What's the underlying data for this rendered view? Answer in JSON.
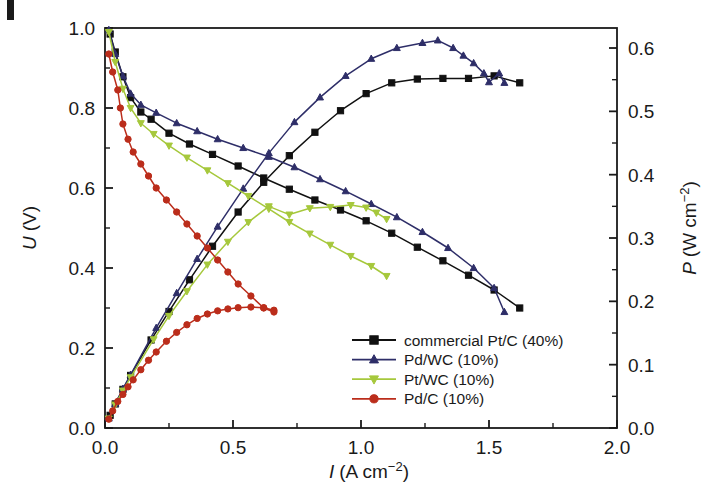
{
  "figure": {
    "panel_mark": "",
    "background": "#ffffff"
  },
  "chart_data": {
    "type": "line",
    "title": "",
    "subtitle": "",
    "xlabel": "I (A cm−2)",
    "xlabel_symbol": "I",
    "xlabel_unit": "(A cm",
    "xlabel_exp": "−2",
    "xlabel_close": ")",
    "ylabel_left": "U (V)",
    "ylabel_left_symbol": "U",
    "ylabel_left_unit": "(V)",
    "ylabel_right": "P (W cm−2)",
    "ylabel_right_symbol": "P",
    "ylabel_right_unit": "(W cm",
    "ylabel_right_exp": "−2",
    "ylabel_right_close": ")",
    "xlim": [
      0.0,
      2.0
    ],
    "ylim_left": [
      0.0,
      1.0
    ],
    "ylim_right": [
      0.0,
      0.6316
    ],
    "xticks": [
      0.0,
      0.5,
      1.0,
      1.5,
      2.0
    ],
    "xtick_labels": [
      "0.0",
      "0.5",
      "1.0",
      "1.5",
      "2.0"
    ],
    "xminor_step": 0.25,
    "yticks_left": [
      0.0,
      0.2,
      0.4,
      0.6,
      0.8,
      1.0
    ],
    "ytick_labels_left": [
      "0.0",
      "0.2",
      "0.4",
      "0.6",
      "0.8",
      "1.0"
    ],
    "yminor_step_left": 0.1,
    "yticks_right": [
      0.0,
      0.1,
      0.2,
      0.3,
      0.4,
      0.5,
      0.6
    ],
    "ytick_labels_right": [
      "0.0",
      "0.1",
      "0.2",
      "0.3",
      "0.4",
      "0.5",
      "0.6"
    ],
    "yminor_step_right": 0.05,
    "grid": false,
    "legend_position": "lower right",
    "legend": [
      {
        "label": "commercial Pt/C (40%)",
        "color": "#111111",
        "marker": "square"
      },
      {
        "label": "Pd/WC (10%)",
        "color": "#2e2e68",
        "marker": "triangle-up"
      },
      {
        "label": "Pt/WC (10%)",
        "color": "#a6c83c",
        "marker": "triangle-down"
      },
      {
        "label": "Pd/C (10%)",
        "color": "#bb2d1b",
        "marker": "circle"
      }
    ],
    "series": [
      {
        "name": "commercial Pt/C (40%) polarization",
        "axis": "left",
        "quantity": "U",
        "color": "#111111",
        "marker": "square",
        "points": [
          [
            0.02,
            0.985
          ],
          [
            0.04,
            0.94
          ],
          [
            0.07,
            0.878
          ],
          [
            0.1,
            0.826
          ],
          [
            0.14,
            0.79
          ],
          [
            0.18,
            0.772
          ],
          [
            0.25,
            0.737
          ],
          [
            0.33,
            0.71
          ],
          [
            0.42,
            0.684
          ],
          [
            0.52,
            0.655
          ],
          [
            0.62,
            0.625
          ],
          [
            0.72,
            0.597
          ],
          [
            0.82,
            0.57
          ],
          [
            0.92,
            0.545
          ],
          [
            1.02,
            0.518
          ],
          [
            1.12,
            0.487
          ],
          [
            1.22,
            0.452
          ],
          [
            1.32,
            0.418
          ],
          [
            1.42,
            0.382
          ],
          [
            1.52,
            0.345
          ],
          [
            1.62,
            0.3
          ]
        ]
      },
      {
        "name": "commercial Pt/C (40%) power",
        "axis": "right",
        "quantity": "P",
        "color": "#111111",
        "marker": "square",
        "points": [
          [
            0.02,
            0.02
          ],
          [
            0.04,
            0.038
          ],
          [
            0.07,
            0.061
          ],
          [
            0.1,
            0.083
          ],
          [
            0.18,
            0.139
          ],
          [
            0.25,
            0.184
          ],
          [
            0.33,
            0.234
          ],
          [
            0.42,
            0.287
          ],
          [
            0.52,
            0.341
          ],
          [
            0.62,
            0.388
          ],
          [
            0.72,
            0.43
          ],
          [
            0.82,
            0.467
          ],
          [
            0.92,
            0.501
          ],
          [
            1.02,
            0.528
          ],
          [
            1.12,
            0.545
          ],
          [
            1.22,
            0.551
          ],
          [
            1.32,
            0.552
          ],
          [
            1.42,
            0.552
          ],
          [
            1.52,
            0.556
          ],
          [
            1.62,
            0.545
          ]
        ]
      },
      {
        "name": "Pd/WC (10%) polarization",
        "axis": "left",
        "quantity": "U",
        "color": "#2e2e68",
        "marker": "triangle-up",
        "points": [
          [
            0.015,
            0.995
          ],
          [
            0.04,
            0.935
          ],
          [
            0.07,
            0.88
          ],
          [
            0.1,
            0.836
          ],
          [
            0.14,
            0.808
          ],
          [
            0.2,
            0.788
          ],
          [
            0.28,
            0.762
          ],
          [
            0.36,
            0.742
          ],
          [
            0.44,
            0.722
          ],
          [
            0.54,
            0.7
          ],
          [
            0.64,
            0.678
          ],
          [
            0.74,
            0.652
          ],
          [
            0.84,
            0.622
          ],
          [
            0.94,
            0.592
          ],
          [
            1.04,
            0.56
          ],
          [
            1.14,
            0.527
          ],
          [
            1.24,
            0.49
          ],
          [
            1.34,
            0.45
          ],
          [
            1.44,
            0.4
          ],
          [
            1.52,
            0.35
          ],
          [
            1.56,
            0.29
          ]
        ]
      },
      {
        "name": "Pd/WC (10%) power",
        "axis": "right",
        "quantity": "P",
        "color": "#2e2e68",
        "marker": "triangle-up",
        "points": [
          [
            0.015,
            0.015
          ],
          [
            0.04,
            0.038
          ],
          [
            0.07,
            0.062
          ],
          [
            0.1,
            0.084
          ],
          [
            0.2,
            0.158
          ],
          [
            0.28,
            0.213
          ],
          [
            0.36,
            0.267
          ],
          [
            0.44,
            0.318
          ],
          [
            0.54,
            0.378
          ],
          [
            0.64,
            0.434
          ],
          [
            0.74,
            0.483
          ],
          [
            0.84,
            0.522
          ],
          [
            0.94,
            0.556
          ],
          [
            1.04,
            0.583
          ],
          [
            1.14,
            0.6
          ],
          [
            1.24,
            0.608
          ],
          [
            1.3,
            0.612
          ],
          [
            1.36,
            0.6
          ],
          [
            1.4,
            0.588
          ],
          [
            1.44,
            0.576
          ],
          [
            1.48,
            0.56
          ],
          [
            1.5,
            0.546
          ],
          [
            1.54,
            0.56
          ],
          [
            1.56,
            0.545
          ]
        ]
      },
      {
        "name": "Pt/WC (10%) polarization",
        "axis": "left",
        "quantity": "U",
        "color": "#a6c83c",
        "marker": "triangle-down",
        "points": [
          [
            0.015,
            0.99
          ],
          [
            0.04,
            0.915
          ],
          [
            0.07,
            0.848
          ],
          [
            0.1,
            0.8
          ],
          [
            0.14,
            0.762
          ],
          [
            0.19,
            0.735
          ],
          [
            0.25,
            0.706
          ],
          [
            0.32,
            0.676
          ],
          [
            0.4,
            0.644
          ],
          [
            0.48,
            0.612
          ],
          [
            0.56,
            0.58
          ],
          [
            0.64,
            0.548
          ],
          [
            0.72,
            0.515
          ],
          [
            0.8,
            0.486
          ],
          [
            0.88,
            0.458
          ],
          [
            0.96,
            0.43
          ],
          [
            1.04,
            0.405
          ],
          [
            1.1,
            0.38
          ]
        ]
      },
      {
        "name": "Pt/WC (10%) power",
        "axis": "right",
        "quantity": "P",
        "color": "#a6c83c",
        "marker": "triangle-down",
        "points": [
          [
            0.015,
            0.015
          ],
          [
            0.04,
            0.037
          ],
          [
            0.07,
            0.059
          ],
          [
            0.1,
            0.08
          ],
          [
            0.19,
            0.14
          ],
          [
            0.25,
            0.177
          ],
          [
            0.32,
            0.216
          ],
          [
            0.4,
            0.258
          ],
          [
            0.48,
            0.294
          ],
          [
            0.56,
            0.325
          ],
          [
            0.64,
            0.35
          ],
          [
            0.72,
            0.337
          ],
          [
            0.8,
            0.347
          ],
          [
            0.88,
            0.349
          ],
          [
            0.96,
            0.352
          ],
          [
            1.02,
            0.348
          ],
          [
            1.06,
            0.34
          ],
          [
            1.1,
            0.33
          ]
        ]
      },
      {
        "name": "Pd/C (10%) polarization",
        "axis": "left",
        "quantity": "U",
        "color": "#bb2d1b",
        "marker": "circle",
        "points": [
          [
            0.015,
            0.935
          ],
          [
            0.03,
            0.89
          ],
          [
            0.05,
            0.845
          ],
          [
            0.06,
            0.8
          ],
          [
            0.07,
            0.76
          ],
          [
            0.09,
            0.722
          ],
          [
            0.11,
            0.69
          ],
          [
            0.14,
            0.66
          ],
          [
            0.17,
            0.63
          ],
          [
            0.2,
            0.6
          ],
          [
            0.24,
            0.57
          ],
          [
            0.28,
            0.54
          ],
          [
            0.32,
            0.51
          ],
          [
            0.36,
            0.48
          ],
          [
            0.4,
            0.45
          ],
          [
            0.44,
            0.42
          ],
          [
            0.48,
            0.39
          ],
          [
            0.52,
            0.36
          ],
          [
            0.57,
            0.33
          ],
          [
            0.62,
            0.3
          ],
          [
            0.66,
            0.29
          ]
        ]
      },
      {
        "name": "Pd/C (10%) power",
        "axis": "right",
        "quantity": "P",
        "color": "#bb2d1b",
        "marker": "circle",
        "points": [
          [
            0.015,
            0.014
          ],
          [
            0.03,
            0.027
          ],
          [
            0.05,
            0.042
          ],
          [
            0.07,
            0.053
          ],
          [
            0.09,
            0.065
          ],
          [
            0.11,
            0.076
          ],
          [
            0.14,
            0.092
          ],
          [
            0.17,
            0.107
          ],
          [
            0.2,
            0.12
          ],
          [
            0.24,
            0.137
          ],
          [
            0.28,
            0.151
          ],
          [
            0.32,
            0.163
          ],
          [
            0.36,
            0.173
          ],
          [
            0.4,
            0.18
          ],
          [
            0.44,
            0.185
          ],
          [
            0.48,
            0.188
          ],
          [
            0.52,
            0.19
          ],
          [
            0.57,
            0.191
          ],
          [
            0.62,
            0.19
          ],
          [
            0.66,
            0.186
          ]
        ]
      }
    ]
  }
}
